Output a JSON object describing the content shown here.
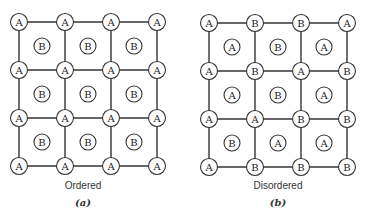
{
  "diagrams": [
    {
      "id": "a",
      "caption": "Ordered",
      "label": "(a)",
      "origin_x": 19,
      "origin_y": 22,
      "spacing_x": 46,
      "spacing_y": 48,
      "corner_sites": [
        [
          "A",
          "A",
          "A",
          "A"
        ],
        [
          "A",
          "A",
          "A",
          "A"
        ],
        [
          "A",
          "A",
          "A",
          "A"
        ],
        [
          "A",
          "A",
          "A",
          "A"
        ]
      ],
      "center_sites": [
        [
          "B",
          "B",
          "B"
        ],
        [
          "B",
          "B",
          "B"
        ],
        [
          "B",
          "B",
          "B"
        ]
      ]
    },
    {
      "id": "b",
      "caption": "Disordered",
      "label": "(b)",
      "origin_x": 209,
      "origin_y": 23,
      "spacing_x": 46,
      "spacing_y": 48,
      "corner_sites": [
        [
          "A",
          "B",
          "B",
          "A"
        ],
        [
          "A",
          "B",
          "A",
          "B"
        ],
        [
          "A",
          "A",
          "B",
          "B"
        ],
        [
          "A",
          "B",
          "B",
          "B"
        ]
      ],
      "center_sites": [
        [
          "A",
          "B",
          "A"
        ],
        [
          "A",
          "B",
          "A"
        ],
        [
          "B",
          "A",
          "A"
        ]
      ]
    }
  ],
  "style": {
    "line_color": "#333333",
    "node_radius": 8.5,
    "center_radius": 8
  }
}
